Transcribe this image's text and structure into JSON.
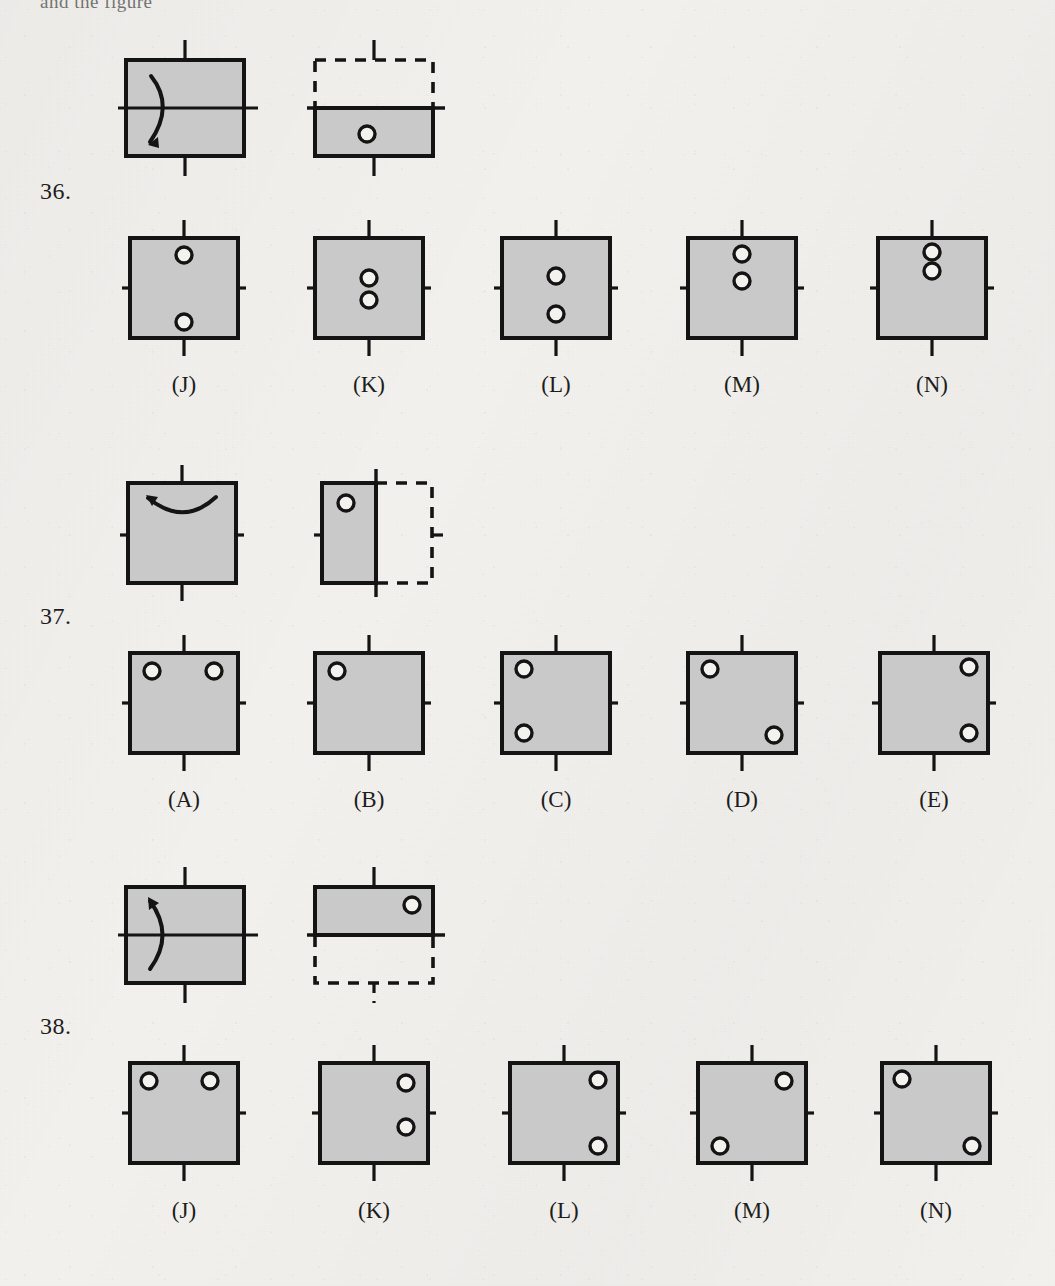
{
  "page": {
    "top_cut_text": "and the figure",
    "paper_color": "#f3f2ef",
    "fill_color": "#c9c9c9",
    "ink_color": "#141414"
  },
  "problems": [
    {
      "number": "36.",
      "fold_axis": "horizontal",
      "prompt": {
        "start": {
          "shape": "square",
          "fold_line": "horizontal-center",
          "arrow": "fold-bottom-up-left-side",
          "ticks": [
            "top",
            "bottom",
            "left",
            "right"
          ]
        },
        "result": {
          "shape": "bottom-half-rectangle",
          "ghost": "top-half-dashed",
          "ticks": [
            "top",
            "bottom"
          ],
          "holes": [
            {
              "x": 0.5,
              "y": 0.62
            }
          ]
        }
      },
      "options": [
        {
          "label": "(J)",
          "holes": [
            {
              "x": 0.5,
              "y": 0.16
            },
            {
              "x": 0.5,
              "y": 0.84
            }
          ]
        },
        {
          "label": "(K)",
          "holes": [
            {
              "x": 0.5,
              "y": 0.4
            },
            {
              "x": 0.5,
              "y": 0.62
            }
          ]
        },
        {
          "label": "(L)",
          "holes": [
            {
              "x": 0.5,
              "y": 0.38
            },
            {
              "x": 0.5,
              "y": 0.76
            }
          ]
        },
        {
          "label": "(M)",
          "holes": [
            {
              "x": 0.5,
              "y": 0.14
            },
            {
              "x": 0.5,
              "y": 0.42
            }
          ]
        },
        {
          "label": "(N)",
          "holes": [
            {
              "x": 0.5,
              "y": 0.12
            },
            {
              "x": 0.5,
              "y": 0.3
            }
          ]
        }
      ]
    },
    {
      "number": "37.",
      "fold_axis": "vertical",
      "prompt": {
        "start": {
          "shape": "square",
          "fold_line": "vertical-center",
          "arrow": "fold-right-to-left-top",
          "ticks": [
            "top",
            "bottom",
            "left",
            "right"
          ]
        },
        "result": {
          "shape": "left-half-rectangle",
          "ghost": "right-half-dashed",
          "ticks": [
            "left",
            "right"
          ],
          "holes": [
            {
              "x": 0.4,
              "y": 0.16
            }
          ]
        }
      },
      "options": [
        {
          "label": "(A)",
          "holes": [
            {
              "x": 0.2,
              "y": 0.16
            },
            {
              "x": 0.74,
              "y": 0.16
            }
          ]
        },
        {
          "label": "(B)",
          "holes": [
            {
              "x": 0.2,
              "y": 0.16
            }
          ]
        },
        {
          "label": "(C)",
          "holes": [
            {
              "x": 0.2,
              "y": 0.14
            },
            {
              "x": 0.2,
              "y": 0.78
            }
          ]
        },
        {
          "label": "(D)",
          "holes": [
            {
              "x": 0.2,
              "y": 0.14
            },
            {
              "x": 0.76,
              "y": 0.8
            }
          ]
        },
        {
          "label": "(E)",
          "holes": [
            {
              "x": 0.8,
              "y": 0.12
            },
            {
              "x": 0.8,
              "y": 0.78
            }
          ]
        }
      ]
    },
    {
      "number": "38.",
      "fold_axis": "horizontal",
      "prompt": {
        "start": {
          "shape": "square",
          "fold_line": "horizontal-center",
          "arrow": "fold-bottom-up-left-side",
          "ticks": [
            "top",
            "bottom",
            "left",
            "right"
          ]
        },
        "result": {
          "shape": "top-half-rectangle",
          "ghost": "bottom-half-dashed",
          "ticks": [
            "top",
            "bottom"
          ],
          "holes": [
            {
              "x": 0.82,
              "y": 0.3
            }
          ]
        }
      },
      "options": [
        {
          "label": "(J)",
          "holes": [
            {
              "x": 0.16,
              "y": 0.16
            },
            {
              "x": 0.74,
              "y": 0.16
            }
          ]
        },
        {
          "label": "(K)",
          "holes": [
            {
              "x": 0.8,
              "y": 0.18
            },
            {
              "x": 0.8,
              "y": 0.62
            }
          ]
        },
        {
          "label": "(L)",
          "holes": [
            {
              "x": 0.82,
              "y": 0.14
            },
            {
              "x": 0.82,
              "y": 0.84
            }
          ]
        },
        {
          "label": "(M)",
          "holes": [
            {
              "x": 0.8,
              "y": 0.16
            },
            {
              "x": 0.16,
              "y": 0.84
            }
          ]
        },
        {
          "label": "(N)",
          "holes": [
            {
              "x": 0.16,
              "y": 0.14
            },
            {
              "x": 0.84,
              "y": 0.84
            }
          ]
        }
      ]
    }
  ],
  "layout": {
    "problem_tops": [
      30,
      450,
      860
    ],
    "qnum_offsets": [
      165,
      590,
      1000
    ],
    "option_xs": [
      130,
      315,
      500,
      685,
      875
    ],
    "prompt_xs": [
      128,
      320
    ]
  }
}
